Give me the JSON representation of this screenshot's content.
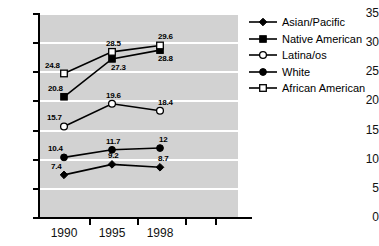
{
  "chart_data": {
    "type": "line",
    "title": "",
    "xlabel": "",
    "ylabel": "",
    "categories": [
      "1990",
      "1995",
      "1998"
    ],
    "ylim": [
      0,
      35
    ],
    "yticks": [
      0,
      5,
      10,
      15,
      20,
      25,
      30,
      35
    ],
    "grid": true,
    "legend_position": "right",
    "plot_background": "#d2d2d2",
    "gridline_color": "#ffffff",
    "line_color": "#000000",
    "series": [
      {
        "name": "Asian/Pacific",
        "marker": "filled-diamond",
        "values": [
          7.4,
          9.2,
          8.7
        ],
        "labels": [
          "7.4",
          "9.2",
          "8.7"
        ]
      },
      {
        "name": "Native American",
        "marker": "filled-square",
        "values": [
          20.8,
          27.3,
          28.8
        ],
        "labels": [
          "20.8",
          "27.3",
          "28.8"
        ]
      },
      {
        "name": "Latina/os",
        "marker": "open-circle",
        "values": [
          15.7,
          19.6,
          18.4
        ],
        "labels": [
          "15.7",
          "19.6",
          "18.4"
        ]
      },
      {
        "name": "White",
        "marker": "filled-circle",
        "values": [
          10.4,
          11.7,
          12.0
        ],
        "labels": [
          "10.4",
          "11.7",
          "12"
        ]
      },
      {
        "name": "African American",
        "marker": "open-square",
        "values": [
          24.8,
          28.5,
          29.6
        ],
        "labels": [
          "24.8",
          "28.5",
          "29.6"
        ]
      }
    ]
  },
  "axis": {
    "y_labels": [
      "35",
      "30",
      "25",
      "20",
      "15",
      "10",
      "5",
      "0"
    ],
    "x_labels": [
      "1990",
      "1995",
      "1998"
    ]
  },
  "legend": {
    "items": [
      {
        "label": "Asian/Pacific"
      },
      {
        "label": "Native American"
      },
      {
        "label": "Latina/os"
      },
      {
        "label": "White"
      },
      {
        "label": "African American"
      }
    ]
  }
}
